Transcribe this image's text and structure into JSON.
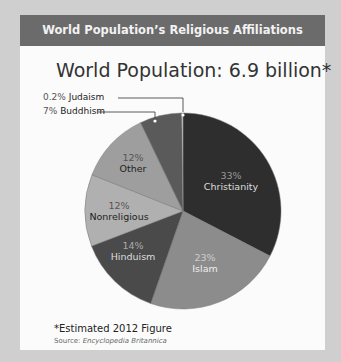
{
  "header": {
    "title": "World Population’s Religious Affiliations"
  },
  "subtitle": "World Population: 6.9 billion*",
  "footnote": "*Estimated 2012 Figure",
  "source": {
    "prefix": "Source:",
    "name": "Encyclopedia Britannica"
  },
  "chart_data": {
    "type": "pie",
    "title": "World Population: 6.9 billion*",
    "categories": [
      "Christianity",
      "Islam",
      "Hinduism",
      "Nonreligious",
      "Other",
      "Buddhism",
      "Judaism"
    ],
    "values": [
      33,
      23,
      14,
      12,
      12,
      7,
      0.2
    ],
    "labels": [
      "33%",
      "23%",
      "14%",
      "12%",
      "12%",
      "7%",
      "0.2%"
    ],
    "colors": [
      "#2e2e2e",
      "#8c8c8c",
      "#4a4a4a",
      "#b0b0b0",
      "#9e9e9e",
      "#5a5a5a",
      "#dddddd"
    ],
    "legend_position": "callouts"
  },
  "callouts": {
    "judaism": {
      "pct": "0.2%",
      "name": "Judaism"
    },
    "buddhism": {
      "pct": "7%",
      "name": "Buddhism"
    }
  },
  "slice_labels": {
    "christianity": {
      "pct": "33%",
      "name": "Christianity"
    },
    "islam": {
      "pct": "23%",
      "name": "Islam"
    },
    "hinduism": {
      "pct": "14%",
      "name": "Hinduism"
    },
    "nonreligious": {
      "pct": "12%",
      "name": "Nonreligious"
    },
    "other": {
      "pct": "12%",
      "name": "Other"
    }
  }
}
